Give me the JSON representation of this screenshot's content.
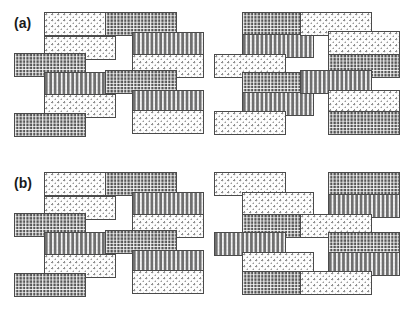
{
  "figure": {
    "caption_labels": [
      "(a)",
      "(b)"
    ],
    "background_color": "#ffffff",
    "outline_color": "#4a4a4a",
    "block_width": 72,
    "block_height": 24,
    "textures": {
      "light": {
        "name": "light-stipple",
        "color": "#fdfdfd",
        "dot_color": "#8e8e8e"
      },
      "medium": {
        "name": "medium-wave",
        "color": "#ececed",
        "line_color": "#6f6f6f"
      },
      "dark": {
        "name": "dark-dense",
        "color": "#8d8d8d",
        "line_color": "#282828"
      }
    }
  },
  "panels": [
    {
      "id": "panel-a",
      "label": "(a)",
      "label_x": 14,
      "label_y": 16,
      "top": 0,
      "stacks": [
        {
          "id": "stack-a1",
          "left": 14,
          "blocks": [
            {
              "x": 30,
              "y": 12,
              "tex": "light"
            },
            {
              "x": 30,
              "y": 36,
              "tex": "light"
            },
            {
              "x": 0,
              "y": 53,
              "tex": "dark"
            },
            {
              "x": 30,
              "y": 72,
              "tex": "medium"
            },
            {
              "x": 30,
              "y": 94,
              "tex": "light"
            },
            {
              "x": 0,
              "y": 113,
              "tex": "dark"
            }
          ]
        },
        {
          "id": "stack-a2",
          "left": 105,
          "blocks": [
            {
              "x": 0,
              "y": 12,
              "tex": "dark"
            },
            {
              "x": 27,
              "y": 32,
              "tex": "medium"
            },
            {
              "x": 27,
              "y": 54,
              "tex": "light"
            },
            {
              "x": 0,
              "y": 70,
              "tex": "dark"
            },
            {
              "x": 27,
              "y": 90,
              "tex": "medium"
            },
            {
              "x": 27,
              "y": 110,
              "tex": "light"
            }
          ]
        },
        {
          "id": "stack-a3",
          "left": 200,
          "blocks": [
            {
              "x": 42,
              "y": 12,
              "tex": "dark"
            },
            {
              "x": 42,
              "y": 34,
              "tex": "medium"
            },
            {
              "x": 14,
              "y": 54,
              "tex": "light"
            },
            {
              "x": 42,
              "y": 72,
              "tex": "dark"
            },
            {
              "x": 42,
              "y": 92,
              "tex": "medium"
            },
            {
              "x": 14,
              "y": 111,
              "tex": "light"
            }
          ]
        },
        {
          "id": "stack-a4",
          "left": 292,
          "blocks": [
            {
              "x": 8,
              "y": 12,
              "tex": "light"
            },
            {
              "x": 36,
              "y": 31,
              "tex": "light"
            },
            {
              "x": 36,
              "y": 54,
              "tex": "dark"
            },
            {
              "x": 8,
              "y": 70,
              "tex": "medium"
            },
            {
              "x": 36,
              "y": 90,
              "tex": "light"
            },
            {
              "x": 36,
              "y": 111,
              "tex": "dark"
            }
          ]
        }
      ]
    },
    {
      "id": "panel-b",
      "label": "(b)",
      "label_x": 14,
      "label_y": 176,
      "top": 160,
      "stacks": [
        {
          "id": "stack-b1",
          "left": 14,
          "blocks": [
            {
              "x": 30,
              "y": 12,
              "tex": "light"
            },
            {
              "x": 30,
              "y": 36,
              "tex": "light"
            },
            {
              "x": 0,
              "y": 53,
              "tex": "dark"
            },
            {
              "x": 30,
              "y": 72,
              "tex": "medium"
            },
            {
              "x": 30,
              "y": 94,
              "tex": "light"
            },
            {
              "x": 0,
              "y": 113,
              "tex": "dark"
            }
          ]
        },
        {
          "id": "stack-b2",
          "left": 105,
          "blocks": [
            {
              "x": 0,
              "y": 12,
              "tex": "dark"
            },
            {
              "x": 27,
              "y": 32,
              "tex": "medium"
            },
            {
              "x": 27,
              "y": 54,
              "tex": "light"
            },
            {
              "x": 0,
              "y": 70,
              "tex": "dark"
            },
            {
              "x": 27,
              "y": 90,
              "tex": "medium"
            },
            {
              "x": 27,
              "y": 110,
              "tex": "light"
            }
          ]
        },
        {
          "id": "stack-b3",
          "left": 200,
          "blocks": [
            {
              "x": 14,
              "y": 12,
              "tex": "light"
            },
            {
              "x": 42,
              "y": 32,
              "tex": "light"
            },
            {
              "x": 42,
              "y": 54,
              "tex": "dark"
            },
            {
              "x": 14,
              "y": 72,
              "tex": "medium"
            },
            {
              "x": 42,
              "y": 92,
              "tex": "light"
            },
            {
              "x": 42,
              "y": 111,
              "tex": "dark"
            }
          ]
        },
        {
          "id": "stack-b4",
          "left": 292,
          "blocks": [
            {
              "x": 36,
              "y": 12,
              "tex": "dark"
            },
            {
              "x": 36,
              "y": 34,
              "tex": "medium"
            },
            {
              "x": 8,
              "y": 54,
              "tex": "light"
            },
            {
              "x": 36,
              "y": 72,
              "tex": "dark"
            },
            {
              "x": 36,
              "y": 92,
              "tex": "medium"
            },
            {
              "x": 8,
              "y": 111,
              "tex": "light"
            }
          ]
        }
      ]
    }
  ]
}
